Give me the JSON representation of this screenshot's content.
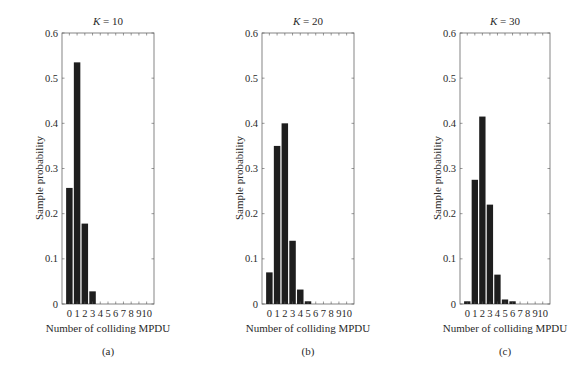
{
  "figure": {
    "panels": [
      {
        "title_var": "K",
        "title_eq": " = 10",
        "caption": "(a)",
        "xlabel": "Number of colliding MPDU",
        "ylabel": "Sample probability"
      },
      {
        "title_var": "K",
        "title_eq": " = 20",
        "caption": "(b)",
        "xlabel": "Number of colliding MPDU",
        "ylabel": "Sample probability"
      },
      {
        "title_var": "K",
        "title_eq": " = 30",
        "caption": "(c)",
        "xlabel": "Number of colliding MPDU",
        "ylabel": "Sample probability"
      }
    ],
    "bar_color": "#1e1e1e"
  },
  "chart_data": [
    {
      "type": "bar",
      "title": "K = 10",
      "xlabel": "Number of colliding MPDU",
      "ylabel": "Sample probability",
      "categories": [
        "0",
        "1",
        "2",
        "3",
        "4",
        "5",
        "6",
        "7",
        "8",
        "9",
        "10"
      ],
      "values": [
        0.257,
        0.535,
        0.178,
        0.028,
        0,
        0,
        0,
        0,
        0,
        0,
        0
      ],
      "yticks": [
        "0",
        "0.1",
        "0.2",
        "0.3",
        "0.4",
        "0.5",
        "0.6"
      ],
      "ylim": [
        0,
        0.6
      ],
      "grid": false,
      "caption": "(a)"
    },
    {
      "type": "bar",
      "title": "K = 20",
      "xlabel": "Number of colliding MPDU",
      "ylabel": "Sample probability",
      "categories": [
        "0",
        "1",
        "2",
        "3",
        "4",
        "5",
        "6",
        "7",
        "8",
        "9",
        "10"
      ],
      "values": [
        0.07,
        0.35,
        0.4,
        0.14,
        0.032,
        0.006,
        0,
        0,
        0,
        0,
        0
      ],
      "yticks": [
        "0",
        "0.1",
        "0.2",
        "0.3",
        "0.4",
        "0.5",
        "0.6"
      ],
      "ylim": [
        0,
        0.6
      ],
      "grid": false,
      "caption": "(b)"
    },
    {
      "type": "bar",
      "title": "K = 30",
      "xlabel": "Number of colliding MPDU",
      "ylabel": "Sample probability",
      "categories": [
        "0",
        "1",
        "2",
        "3",
        "4",
        "5",
        "6",
        "7",
        "8",
        "9",
        "10"
      ],
      "values": [
        0.006,
        0.275,
        0.415,
        0.22,
        0.065,
        0.01,
        0.006,
        0,
        0,
        0,
        0
      ],
      "yticks": [
        "0",
        "0.1",
        "0.2",
        "0.3",
        "0.4",
        "0.5",
        "0.6"
      ],
      "ylim": [
        0,
        0.6
      ],
      "grid": false,
      "caption": "(c)"
    }
  ]
}
